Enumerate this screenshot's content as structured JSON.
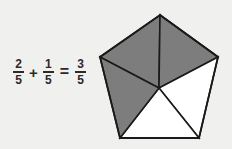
{
  "figure": {
    "background_color": "#f0f0ee"
  },
  "equation": {
    "addend1": {
      "numerator": "2",
      "denominator": "5"
    },
    "plus_sign": "+",
    "addend2": {
      "numerator": "1",
      "denominator": "5"
    },
    "equals_sign": "=",
    "sum": {
      "numerator": "3",
      "denominator": "5"
    },
    "text_color": "#2b2b2b"
  },
  "pentagon": {
    "total_parts": 5,
    "shaded_parts": 3,
    "unshaded_parts": 2,
    "shaded_color": "#7d7d7d",
    "unshaded_color": "#ffffff",
    "outline_color": "#1a1a1a",
    "center": {
      "x": 159,
      "y": 88
    },
    "vertices": [
      {
        "name": "top",
        "x": 160,
        "y": 15
      },
      {
        "name": "right",
        "x": 218,
        "y": 57
      },
      {
        "name": "bottom-right",
        "x": 199,
        "y": 138
      },
      {
        "name": "bottom-left",
        "x": 120,
        "y": 138
      },
      {
        "name": "left",
        "x": 100,
        "y": 57
      }
    ],
    "segments": [
      {
        "name": "top-left-wedge",
        "points": "100,57 160,15 159,88",
        "shaded": true
      },
      {
        "name": "top-right-wedge",
        "points": "160,15 218,57 159,88",
        "shaded": true
      },
      {
        "name": "right-wedge",
        "points": "218,57 199,138 159,88",
        "shaded": false
      },
      {
        "name": "bottom-wedge",
        "points": "199,138 120,138 159,88",
        "shaded": false
      },
      {
        "name": "left-wedge",
        "points": "120,138 100,57 159,88",
        "shaded": true
      }
    ]
  }
}
